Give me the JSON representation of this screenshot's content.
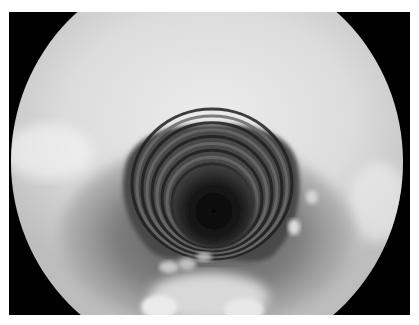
{
  "image": {
    "subject": "endoscopic view of airway lumen with cartilage rings",
    "colors": {
      "frame": "#000000",
      "field_light": "#e4e4e4",
      "field_mid": "#9a9a9a",
      "lumen_dark": "#0a0a0a"
    },
    "ring_count": 9
  }
}
